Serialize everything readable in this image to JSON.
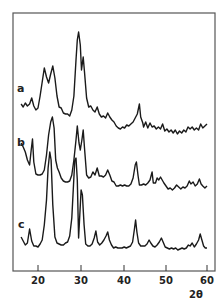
{
  "chart_data": {
    "type": "line",
    "title": "",
    "xlabel": "2θ",
    "ylabel": "",
    "xlim": [
      15,
      61
    ],
    "x_ticks": [
      20,
      30,
      40,
      50,
      60
    ],
    "x_tick_labels": [
      "20",
      "30",
      "40",
      "50",
      "60"
    ],
    "grid": false,
    "legend": "inline labels at left of each trace",
    "y_units": "relative intensity (offset traces, screen rows)",
    "series": [
      {
        "name": "a",
        "label_pos": {
          "x": 17,
          "y": 92
        },
        "points": [
          [
            16,
            104
          ],
          [
            16.5,
            107
          ],
          [
            17,
            103
          ],
          [
            17.5,
            106
          ],
          [
            18,
            104
          ],
          [
            18.5,
            98
          ],
          [
            19,
            106
          ],
          [
            19.5,
            110
          ],
          [
            20,
            108
          ],
          [
            20.5,
            96
          ],
          [
            21,
            82
          ],
          [
            21.5,
            68
          ],
          [
            22,
            77
          ],
          [
            22.5,
            83
          ],
          [
            23,
            74
          ],
          [
            23.5,
            66
          ],
          [
            24,
            78
          ],
          [
            24.5,
            96
          ],
          [
            25,
            107
          ],
          [
            25.5,
            108
          ],
          [
            26,
            113
          ],
          [
            26.5,
            114
          ],
          [
            27,
            114
          ],
          [
            27.5,
            116
          ],
          [
            28,
            110
          ],
          [
            28.5,
            96
          ],
          [
            29,
            60
          ],
          [
            29.3,
            40
          ],
          [
            29.6,
            32
          ],
          [
            30,
            45
          ],
          [
            30.3,
            70
          ],
          [
            30.7,
            57
          ],
          [
            31,
            72
          ],
          [
            31.5,
            98
          ],
          [
            32,
            107
          ],
          [
            32.5,
            106
          ],
          [
            33,
            110
          ],
          [
            33.5,
            112
          ],
          [
            34,
            107
          ],
          [
            34.5,
            114
          ],
          [
            35,
            117
          ],
          [
            35.5,
            116
          ],
          [
            36,
            118
          ],
          [
            36.5,
            113
          ],
          [
            37,
            117
          ],
          [
            37.5,
            120
          ],
          [
            38,
            122
          ],
          [
            38.5,
            126
          ],
          [
            39,
            128
          ],
          [
            39.5,
            129
          ],
          [
            40,
            127
          ],
          [
            40.5,
            128
          ],
          [
            41,
            125
          ],
          [
            41.5,
            126
          ],
          [
            42,
            124
          ],
          [
            42.5,
            122
          ],
          [
            43,
            118
          ],
          [
            43.5,
            114
          ],
          [
            44,
            104
          ],
          [
            44.3,
            117
          ],
          [
            44.8,
            123
          ],
          [
            45,
            127
          ],
          [
            45.5,
            122
          ],
          [
            46,
            128
          ],
          [
            46.5,
            123
          ],
          [
            47,
            127
          ],
          [
            47.5,
            126
          ],
          [
            48,
            129
          ],
          [
            48.5,
            127
          ],
          [
            49,
            129
          ],
          [
            49.5,
            124
          ],
          [
            50,
            131
          ],
          [
            50.5,
            129
          ],
          [
            51,
            132
          ],
          [
            51.5,
            130
          ],
          [
            52,
            133
          ],
          [
            52.5,
            130
          ],
          [
            53,
            134
          ],
          [
            53.5,
            131
          ],
          [
            54,
            133
          ],
          [
            54.5,
            130
          ],
          [
            55,
            132
          ],
          [
            55.5,
            127
          ],
          [
            56,
            129
          ],
          [
            56.5,
            127
          ],
          [
            57,
            130
          ],
          [
            57.5,
            128
          ],
          [
            58,
            130
          ],
          [
            58.5,
            124
          ],
          [
            59,
            128
          ],
          [
            59.5,
            126
          ],
          [
            60,
            124
          ]
        ]
      },
      {
        "name": "b",
        "label_pos": {
          "x": 17,
          "y": 146
        },
        "points": [
          [
            16,
            143
          ],
          [
            16.5,
            147
          ],
          [
            17,
            152
          ],
          [
            17.5,
            160
          ],
          [
            18,
            165
          ],
          [
            18.4,
            150
          ],
          [
            18.7,
            139
          ],
          [
            19,
            162
          ],
          [
            19.5,
            174
          ],
          [
            20,
            175
          ],
          [
            20.5,
            175
          ],
          [
            21,
            174
          ],
          [
            21.5,
            170
          ],
          [
            22,
            155
          ],
          [
            22.5,
            135
          ],
          [
            23,
            122
          ],
          [
            23.4,
            117
          ],
          [
            23.8,
            128
          ],
          [
            24.2,
            160
          ],
          [
            24.6,
            168
          ],
          [
            25,
            172
          ],
          [
            25.5,
            178
          ],
          [
            26,
            181
          ],
          [
            26.5,
            182
          ],
          [
            27,
            182
          ],
          [
            27.5,
            181
          ],
          [
            28,
            175
          ],
          [
            28.5,
            160
          ],
          [
            29,
            140
          ],
          [
            29.3,
            126
          ],
          [
            29.7,
            143
          ],
          [
            30,
            150
          ],
          [
            30.4,
            140
          ],
          [
            30.7,
            130
          ],
          [
            31,
            148
          ],
          [
            31.5,
            175
          ],
          [
            32,
            178
          ],
          [
            32.5,
            177
          ],
          [
            33,
            172
          ],
          [
            33.5,
            175
          ],
          [
            34,
            168
          ],
          [
            34.5,
            176
          ],
          [
            35,
            176
          ],
          [
            35.5,
            177
          ],
          [
            36,
            175
          ],
          [
            36.5,
            170
          ],
          [
            37,
            175
          ],
          [
            37.5,
            181
          ],
          [
            38,
            182
          ],
          [
            38.5,
            186
          ],
          [
            39,
            186
          ],
          [
            39.5,
            185
          ],
          [
            40,
            186
          ],
          [
            40.5,
            185
          ],
          [
            41,
            186
          ],
          [
            41.5,
            186
          ],
          [
            42,
            184
          ],
          [
            42.5,
            178
          ],
          [
            43,
            165
          ],
          [
            43.3,
            162
          ],
          [
            43.7,
            176
          ],
          [
            44,
            185
          ],
          [
            44.5,
            185
          ],
          [
            45,
            184
          ],
          [
            45.5,
            185
          ],
          [
            46,
            183
          ],
          [
            46.5,
            180
          ],
          [
            47,
            172
          ],
          [
            47.3,
            183
          ],
          [
            47.8,
            183
          ],
          [
            48.2,
            178
          ],
          [
            48.6,
            180
          ],
          [
            49,
            177
          ],
          [
            49.4,
            180
          ],
          [
            49.8,
            183
          ],
          [
            50.3,
            186
          ],
          [
            50.8,
            189
          ],
          [
            51.3,
            188
          ],
          [
            51.8,
            190
          ],
          [
            52.3,
            188
          ],
          [
            52.8,
            185
          ],
          [
            53.3,
            187
          ],
          [
            53.8,
            189
          ],
          [
            54.3,
            187
          ],
          [
            54.8,
            188
          ],
          [
            55.3,
            186
          ],
          [
            55.8,
            181
          ],
          [
            56.2,
            184
          ],
          [
            56.7,
            182
          ],
          [
            57.2,
            186
          ],
          [
            57.7,
            184
          ],
          [
            58.2,
            179
          ],
          [
            58.6,
            184
          ],
          [
            59,
            186
          ],
          [
            59.5,
            188
          ],
          [
            60,
            186
          ]
        ]
      },
      {
        "name": "c",
        "label_pos": {
          "x": 18,
          "y": 228
        },
        "points": [
          [
            16,
            237
          ],
          [
            16.5,
            241
          ],
          [
            17,
            245
          ],
          [
            17.5,
            243
          ],
          [
            18,
            229
          ],
          [
            18.5,
            241
          ],
          [
            19,
            246
          ],
          [
            19.5,
            246
          ],
          [
            20,
            247
          ],
          [
            20.5,
            244
          ],
          [
            21,
            240
          ],
          [
            21.5,
            225
          ],
          [
            22,
            200
          ],
          [
            22.4,
            168
          ],
          [
            22.8,
            152
          ],
          [
            23.1,
            160
          ],
          [
            23.5,
            205
          ],
          [
            24,
            237
          ],
          [
            24.5,
            243
          ],
          [
            25,
            244
          ],
          [
            25.5,
            245
          ],
          [
            26,
            245
          ],
          [
            26.5,
            243
          ],
          [
            27,
            242
          ],
          [
            27.5,
            236
          ],
          [
            28,
            218
          ],
          [
            28.4,
            185
          ],
          [
            28.7,
            160
          ],
          [
            29,
            158
          ],
          [
            29.3,
            180
          ],
          [
            29.6,
            238
          ],
          [
            29.9,
            215
          ],
          [
            30.2,
            190
          ],
          [
            30.5,
            195
          ],
          [
            30.9,
            225
          ],
          [
            31.3,
            244
          ],
          [
            31.8,
            246
          ],
          [
            32.3,
            246
          ],
          [
            32.8,
            244
          ],
          [
            33.3,
            238
          ],
          [
            33.7,
            231
          ],
          [
            34.1,
            242
          ],
          [
            34.6,
            245
          ],
          [
            35.1,
            243
          ],
          [
            35.6,
            240
          ],
          [
            36.1,
            236
          ],
          [
            36.5,
            232
          ],
          [
            36.9,
            240
          ],
          [
            37.4,
            245
          ],
          [
            37.9,
            248
          ],
          [
            38.4,
            247
          ],
          [
            38.9,
            248
          ],
          [
            39.4,
            248
          ],
          [
            39.9,
            248
          ],
          [
            40.4,
            247
          ],
          [
            40.9,
            248
          ],
          [
            41.4,
            247
          ],
          [
            41.9,
            246
          ],
          [
            42.4,
            242
          ],
          [
            42.8,
            230
          ],
          [
            43.1,
            220
          ],
          [
            43.4,
            232
          ],
          [
            43.8,
            243
          ],
          [
            44.3,
            246
          ],
          [
            44.8,
            246
          ],
          [
            45.3,
            246
          ],
          [
            45.8,
            244
          ],
          [
            46.3,
            240
          ],
          [
            46.7,
            243
          ],
          [
            47.2,
            246
          ],
          [
            47.7,
            247
          ],
          [
            48.2,
            245
          ],
          [
            48.7,
            242
          ],
          [
            49.2,
            238
          ],
          [
            49.6,
            242
          ],
          [
            50.1,
            247
          ],
          [
            50.6,
            248
          ],
          [
            51.1,
            249
          ],
          [
            51.6,
            248
          ],
          [
            52.1,
            249
          ],
          [
            52.6,
            248
          ],
          [
            53.1,
            250
          ],
          [
            53.6,
            249
          ],
          [
            54.1,
            248
          ],
          [
            54.6,
            249
          ],
          [
            55.1,
            248
          ],
          [
            55.6,
            245
          ],
          [
            56,
            246
          ],
          [
            56.5,
            243
          ],
          [
            57,
            247
          ],
          [
            57.5,
            244
          ],
          [
            58,
            240
          ],
          [
            58.4,
            234
          ],
          [
            58.8,
            240
          ],
          [
            59.2,
            246
          ],
          [
            59.6,
            248
          ],
          [
            60,
            248
          ]
        ]
      }
    ]
  },
  "axes": {
    "x_label": "2θ",
    "tick_labels": [
      "20",
      "30",
      "40",
      "50",
      "60"
    ]
  },
  "series_labels": [
    "a",
    "b",
    "c"
  ]
}
